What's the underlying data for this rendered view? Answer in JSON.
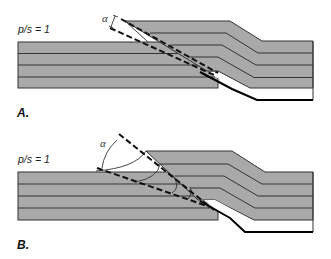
{
  "figure": {
    "panels": [
      {
        "id": "A",
        "label": "A.",
        "ratio_label": "p/s = 1",
        "ratio_parts": {
          "p": "p",
          "slash": "/",
          "s": "s",
          "eq": " = 1"
        },
        "angle_symbol": "α",
        "description": "Fault-bend fold with thin fault-parallel wedge; angle α between dashed lines"
      },
      {
        "id": "B",
        "label": "B.",
        "ratio_label": "p/s = 1",
        "ratio_parts": {
          "p": "p",
          "slash": "/",
          "s": "s",
          "eq": " = 1"
        },
        "angle_symbol": "α",
        "description": "Fault-bend fold with wide wedge and curved (arc) bed-terminations; larger angle α"
      }
    ],
    "colors": {
      "layer_fill": "#a9a9a9",
      "bed_line": "#333333",
      "fault_line": "#000000",
      "background": "#ffffff"
    }
  }
}
